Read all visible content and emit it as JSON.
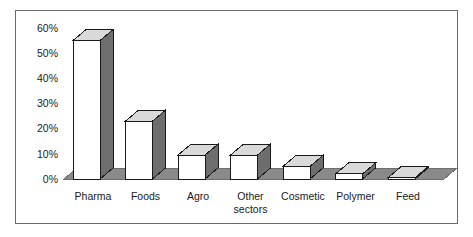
{
  "chart_data": {
    "type": "bar",
    "title": "",
    "subtitle": "",
    "xlabel": "",
    "ylabel": "",
    "categories": [
      "Pharma",
      "Foods",
      "Agro",
      "Other sectors",
      "Cosmetic",
      "Polymer",
      "Feed"
    ],
    "category_lines": [
      [
        "Pharma"
      ],
      [
        "Foods"
      ],
      [
        "Agro"
      ],
      [
        "Other",
        "sectors"
      ],
      [
        "Cosmetic"
      ],
      [
        "Polymer"
      ],
      [
        "Feed"
      ]
    ],
    "values": [
      55,
      23,
      9.5,
      9.5,
      5,
      2,
      0.5
    ],
    "value_labels": [
      "55%",
      "23%",
      "9.5%",
      "9.5%",
      "5%",
      "2%",
      "0.5%"
    ],
    "ylim": [
      0,
      60
    ],
    "ytick_values": [
      0,
      10,
      20,
      30,
      40,
      50,
      60
    ],
    "ytick_labels": [
      "0%",
      "10%",
      "20%",
      "30%",
      "40%",
      "50%",
      "60%"
    ],
    "grid": false,
    "legend": null,
    "legend_position": "none",
    "style": "3d-column",
    "colors": {
      "bar_front": "#ffffff",
      "bar_top": "#d9d9d9",
      "bar_side": "#6e6e6e",
      "bar_outline": "#1a1a1a",
      "floor": "#8a8a8a",
      "floor_outline": "#6e6e6e",
      "frame_border": "#6b6b6b",
      "background": "#ffffff",
      "text": "#1a1a1a"
    }
  }
}
